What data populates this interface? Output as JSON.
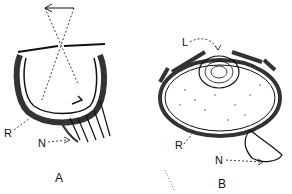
{
  "figure": {
    "panels": [
      {
        "id": "A",
        "label": "A",
        "description": "pinhole eye with inverted image projection",
        "callouts": [
          {
            "letter": "R",
            "target": "retina"
          },
          {
            "letter": "N",
            "target": "nerve"
          }
        ]
      },
      {
        "id": "B",
        "label": "B",
        "description": "lens eye",
        "callouts": [
          {
            "letter": "L",
            "target": "lens"
          },
          {
            "letter": "R",
            "target": "retina"
          },
          {
            "letter": "N",
            "target": "nerve"
          }
        ]
      }
    ]
  }
}
